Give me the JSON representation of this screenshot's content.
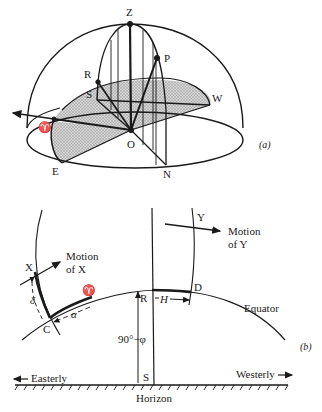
{
  "figure_a": {
    "caption": "(a)",
    "points": {
      "zenith": "Z",
      "pole": "P",
      "R": "R",
      "S": "S",
      "west": "W",
      "aries": "♈",
      "origin": "O",
      "east": "E",
      "north": "N"
    }
  },
  "figure_b": {
    "caption": "(b)",
    "labels": {
      "X": "X",
      "motion_x_line1": "Motion",
      "motion_x_line2": "of X",
      "Y": "Y",
      "motion_y_line1": "Motion",
      "motion_y_line2": "of Y",
      "aries": "♈",
      "C": "C",
      "R": "R",
      "D": "D",
      "S": "S",
      "delta": "δ",
      "alpha": "α",
      "H": "H",
      "colatitude": "90°−φ",
      "equator": "Equator",
      "easterly": "Easterly",
      "westerly": "Westerly",
      "horizon": "Horizon"
    }
  },
  "colors": {
    "ink": "#1a1a1a",
    "shade": "#bdbdbd",
    "background": "#ffffff"
  }
}
